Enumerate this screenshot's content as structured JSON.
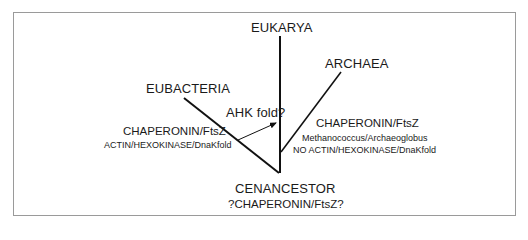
{
  "diagram": {
    "type": "phylogenetic-tree",
    "branches": {
      "eukarya": {
        "label": "EUKARYA"
      },
      "eubacteria": {
        "label": "EUBACTERIA",
        "notes": [
          "CHAPERONIN/FtsZ",
          "ACTIN/HEXOKINASE/DnaKfold"
        ]
      },
      "archaea": {
        "label": "ARCHAEA",
        "notes": [
          "CHAPERONIN/FtsZ",
          "Methanococcus/Archaeoglobus",
          "NO ACTIN/HEXOKINASE/DnaKfold"
        ]
      }
    },
    "transfer_arrow": {
      "label": "AHK fold?"
    },
    "root": {
      "label": "CENANCESTOR",
      "note": "?CHAPERONIN/FtsZ?"
    },
    "colors": {
      "line": "#111111",
      "frame": "#9a9a9a",
      "background": "#ffffff"
    }
  }
}
